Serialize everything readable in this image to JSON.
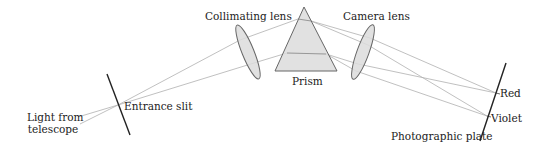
{
  "labels": {
    "light_source_line1": "Light from",
    "light_source_line2": "telescope",
    "entrance_slit": "Entrance slit",
    "collimating_lens": "Collimating lens",
    "prism": "Prism",
    "camera_lens": "Camera lens",
    "red": "Red",
    "violet": "Violet",
    "photographic_plate": "Photographic plate"
  },
  "colors": {
    "ray": "#b0b0b0",
    "optic_fill": "#dcdcdc",
    "optic_stroke": "#666666",
    "line": "#222222"
  }
}
